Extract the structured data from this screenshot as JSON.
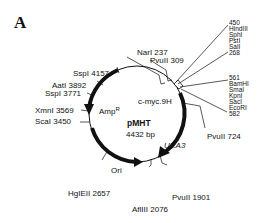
{
  "panel_label": "A",
  "plasmid": {
    "name": "pMHT",
    "size": "4432 bp"
  },
  "features": {
    "amp": "Amp",
    "amp_sup": "R",
    "ori": "Ori",
    "ura3": "URA3",
    "cmyc": "c-myc.9H"
  },
  "sites": {
    "narI": "NarI 237",
    "pvuII_309": "PvuII 309",
    "pvuII_724": "PvuII 724",
    "pvuII_1901": "PvuII 1901",
    "aflIII": "AflIII 2076",
    "hgiEII": "HgIEII 2657",
    "scaI": "ScaI 3450",
    "xmnI": "XmnI 3569",
    "sspI_3771": "SspI 3771",
    "aatI": "AatI 3892",
    "sspI_4157": "SspI 4157"
  },
  "mcs_upper": {
    "start": "450",
    "enzymes": [
      "HindIII",
      "SphI",
      "PstI",
      "SalI"
    ],
    "end": "268"
  },
  "mcs_lower": {
    "start": "561",
    "enzymes": [
      "BamHI",
      "SmaI",
      "KpnI",
      "SacI",
      "EcoRI"
    ],
    "end": "582"
  }
}
